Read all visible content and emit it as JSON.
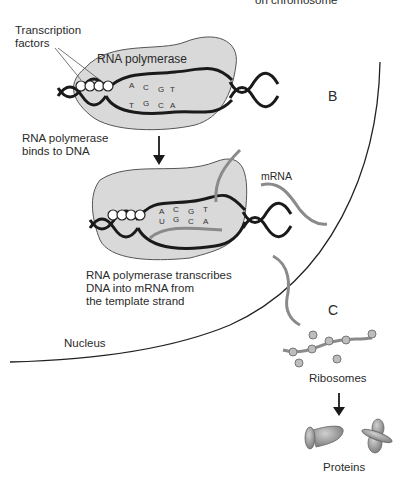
{
  "labels": {
    "top_cut": "on chromosome",
    "transcription_factors_line1": "Transcription",
    "transcription_factors_line2": "factors",
    "rna_polymerase": "RNA polymerase",
    "step1_line1": "RNA polymerase",
    "step1_line2": "binds to DNA",
    "mrna": "mRNA",
    "step2_line1": "RNA polymerase transcribes",
    "step2_line2": "DNA into mRNA from",
    "step2_line3": "the template strand",
    "nucleus": "Nucleus",
    "section_b": "B",
    "section_c": "C",
    "ribosomes": "Ribosomes",
    "proteins": "Proteins"
  },
  "bases": {
    "top_strand_1": [
      "A",
      "C",
      "G",
      "T"
    ],
    "bottom_strand_1": [
      "T",
      "G",
      "C",
      "A"
    ],
    "rna_strand_2": [
      "A",
      "C",
      "G",
      "T"
    ],
    "mrna_strand_2": [
      "U",
      "G",
      "C",
      "A"
    ]
  },
  "colors": {
    "polymerase_fill": "#d9d9d9",
    "dna_stroke": "#1a1a1a",
    "mrna_stroke": "#8a8a8a",
    "ribosome_fill": "#bdbdbd",
    "protein_fill": "#9a9a9a"
  }
}
